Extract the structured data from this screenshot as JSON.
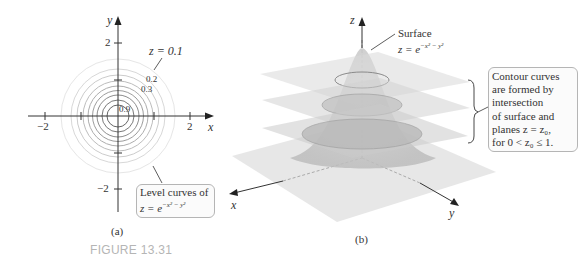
{
  "figure_label": "FIGURE 13.31",
  "panel_a": {
    "caption": "(a)",
    "axis_x_label": "x",
    "axis_y_label": "y",
    "ticks": {
      "x_neg": "−2",
      "x_pos": "2",
      "y_pos": "2",
      "y_neg": "−2"
    },
    "level_labels": {
      "outer": "z = 0.1",
      "l02": "0.2",
      "l03": "0.3",
      "l09": "0.9"
    },
    "level_values": [
      0.1,
      0.2,
      0.3,
      0.4,
      0.5,
      0.6,
      0.7,
      0.8,
      0.9
    ],
    "callout": {
      "line1": "Level curves of",
      "line2": "z = e",
      "exponent": "−x² − y²"
    }
  },
  "panel_b": {
    "caption": "(b)",
    "axis_x_label": "x",
    "axis_y_label": "y",
    "axis_z_label": "z",
    "surface_label": {
      "line1": "Surface",
      "line2": "z = e",
      "exponent": "−x² − y²"
    },
    "callout": {
      "lines": [
        "Contour curves",
        "are formed by",
        "intersection",
        "of surface and",
        "planes z = z₀,",
        "for 0 < z₀ ≤ 1."
      ]
    }
  }
}
